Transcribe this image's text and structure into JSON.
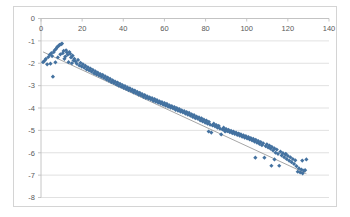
{
  "chart_data": {
    "type": "scatter",
    "title": "",
    "xlabel": "",
    "ylabel": "",
    "xlim": [
      0,
      140
    ],
    "ylim": [
      -8,
      0
    ],
    "grid": true,
    "legend": false,
    "x_ticks": [
      0,
      20,
      40,
      60,
      80,
      100,
      120,
      140
    ],
    "y_ticks": [
      0,
      -1,
      -2,
      -3,
      -4,
      -5,
      -6,
      -7,
      -8
    ],
    "marker_color": "#4472A0",
    "marker_shape": "diamond",
    "trendline": {
      "visible": true,
      "color": "#808080",
      "slope": -0.0425,
      "intercept": -1.45,
      "x_start": 1,
      "x_end": 129
    },
    "series": [
      {
        "name": "Series 1",
        "points": [
          [
            1.0,
            -1.95
          ],
          [
            1.8,
            -1.88
          ],
          [
            2.4,
            -1.8
          ],
          [
            3.0,
            -2.05
          ],
          [
            3.6,
            -1.72
          ],
          [
            4.2,
            -1.62
          ],
          [
            4.6,
            -2.02
          ],
          [
            5.0,
            -1.55
          ],
          [
            5.4,
            -1.68
          ],
          [
            5.8,
            -2.6
          ],
          [
            6.2,
            -1.5
          ],
          [
            6.6,
            -1.42
          ],
          [
            7.0,
            -1.96
          ],
          [
            7.4,
            -1.35
          ],
          [
            7.8,
            -1.28
          ],
          [
            8.2,
            -1.74
          ],
          [
            8.6,
            -1.22
          ],
          [
            9.0,
            -1.18
          ],
          [
            9.4,
            -1.6
          ],
          [
            9.8,
            -1.15
          ],
          [
            10.2,
            -1.12
          ],
          [
            10.6,
            -1.55
          ],
          [
            11.0,
            -1.45
          ],
          [
            11.4,
            -1.8
          ],
          [
            11.8,
            -1.7
          ],
          [
            12.2,
            -1.42
          ],
          [
            12.6,
            -1.52
          ],
          [
            13.0,
            -1.62
          ],
          [
            13.4,
            -1.95
          ],
          [
            13.8,
            -1.5
          ],
          [
            14.2,
            -1.58
          ],
          [
            14.6,
            -1.74
          ],
          [
            15.0,
            -2.0
          ],
          [
            15.4,
            -1.66
          ],
          [
            15.8,
            -1.88
          ],
          [
            16.2,
            -1.8
          ],
          [
            16.8,
            -1.92
          ],
          [
            17.4,
            -2.02
          ],
          [
            18.0,
            -1.85
          ],
          [
            18.6,
            -2.1
          ],
          [
            19.2,
            -1.98
          ],
          [
            19.8,
            -2.15
          ],
          [
            20.4,
            -2.05
          ],
          [
            21.0,
            -2.2
          ],
          [
            21.6,
            -2.12
          ],
          [
            22.2,
            -2.28
          ],
          [
            22.8,
            -2.18
          ],
          [
            23.4,
            -2.32
          ],
          [
            24.0,
            -2.24
          ],
          [
            24.6,
            -2.38
          ],
          [
            25.2,
            -2.3
          ],
          [
            25.8,
            -2.45
          ],
          [
            26.4,
            -2.36
          ],
          [
            27.0,
            -2.5
          ],
          [
            27.6,
            -2.42
          ],
          [
            28.2,
            -2.55
          ],
          [
            28.8,
            -2.48
          ],
          [
            29.4,
            -2.6
          ],
          [
            30.0,
            -2.52
          ],
          [
            30.6,
            -2.66
          ],
          [
            31.2,
            -2.58
          ],
          [
            31.8,
            -2.72
          ],
          [
            32.4,
            -2.64
          ],
          [
            33.0,
            -2.78
          ],
          [
            33.6,
            -2.7
          ],
          [
            34.2,
            -2.84
          ],
          [
            34.8,
            -2.76
          ],
          [
            35.4,
            -2.88
          ],
          [
            36.0,
            -2.82
          ],
          [
            36.6,
            -2.95
          ],
          [
            37.2,
            -2.86
          ],
          [
            37.8,
            -3.0
          ],
          [
            38.4,
            -2.92
          ],
          [
            39.0,
            -3.05
          ],
          [
            39.6,
            -2.98
          ],
          [
            40.2,
            -3.1
          ],
          [
            40.8,
            -3.02
          ],
          [
            41.4,
            -3.15
          ],
          [
            42.0,
            -3.08
          ],
          [
            42.6,
            -3.2
          ],
          [
            43.2,
            -3.12
          ],
          [
            43.8,
            -3.24
          ],
          [
            44.4,
            -3.18
          ],
          [
            45.0,
            -3.3
          ],
          [
            45.6,
            -3.22
          ],
          [
            46.2,
            -3.34
          ],
          [
            46.8,
            -3.28
          ],
          [
            47.4,
            -3.4
          ],
          [
            48.0,
            -3.32
          ],
          [
            48.6,
            -3.44
          ],
          [
            49.2,
            -3.38
          ],
          [
            49.8,
            -3.5
          ],
          [
            50.4,
            -3.42
          ],
          [
            51.0,
            -3.55
          ],
          [
            51.6,
            -3.48
          ],
          [
            52.2,
            -3.58
          ],
          [
            52.8,
            -3.52
          ],
          [
            53.4,
            -3.62
          ],
          [
            54.0,
            -3.56
          ],
          [
            54.6,
            -3.68
          ],
          [
            55.2,
            -3.6
          ],
          [
            55.8,
            -3.72
          ],
          [
            56.4,
            -3.65
          ],
          [
            57.0,
            -3.76
          ],
          [
            57.6,
            -3.7
          ],
          [
            58.2,
            -3.8
          ],
          [
            58.8,
            -3.74
          ],
          [
            59.4,
            -3.85
          ],
          [
            60.0,
            -3.78
          ],
          [
            60.6,
            -3.9
          ],
          [
            61.2,
            -3.82
          ],
          [
            61.8,
            -3.94
          ],
          [
            62.4,
            -3.88
          ],
          [
            63.0,
            -3.98
          ],
          [
            63.6,
            -3.92
          ],
          [
            64.2,
            -4.02
          ],
          [
            64.8,
            -3.96
          ],
          [
            65.4,
            -4.08
          ],
          [
            66.0,
            -4.0
          ],
          [
            66.6,
            -4.12
          ],
          [
            67.2,
            -4.05
          ],
          [
            67.8,
            -4.16
          ],
          [
            68.4,
            -4.1
          ],
          [
            69.0,
            -4.2
          ],
          [
            69.6,
            -4.14
          ],
          [
            70.2,
            -4.25
          ],
          [
            70.8,
            -4.18
          ],
          [
            71.4,
            -4.3
          ],
          [
            72.0,
            -4.22
          ],
          [
            72.6,
            -4.34
          ],
          [
            73.2,
            -4.28
          ],
          [
            73.8,
            -4.4
          ],
          [
            74.4,
            -4.32
          ],
          [
            75.0,
            -4.45
          ],
          [
            75.6,
            -4.38
          ],
          [
            76.2,
            -4.48
          ],
          [
            76.8,
            -4.42
          ],
          [
            77.4,
            -4.55
          ],
          [
            78.0,
            -4.46
          ],
          [
            78.6,
            -4.6
          ],
          [
            79.2,
            -4.52
          ],
          [
            79.8,
            -4.65
          ],
          [
            80.4,
            -4.56
          ],
          [
            81.0,
            -4.7
          ],
          [
            81.6,
            -4.62
          ],
          [
            82.2,
            -4.74
          ],
          [
            82.8,
            -5.1
          ],
          [
            83.4,
            -4.78
          ],
          [
            84.0,
            -4.7
          ],
          [
            84.6,
            -4.82
          ],
          [
            85.2,
            -4.76
          ],
          [
            85.8,
            -4.88
          ],
          [
            86.4,
            -4.8
          ],
          [
            87.0,
            -4.92
          ],
          [
            87.6,
            -5.18
          ],
          [
            88.2,
            -4.96
          ],
          [
            88.8,
            -4.88
          ],
          [
            89.4,
            -5.0
          ],
          [
            90.0,
            -4.94
          ],
          [
            90.6,
            -5.04
          ],
          [
            91.2,
            -4.98
          ],
          [
            91.8,
            -5.08
          ],
          [
            92.4,
            -5.02
          ],
          [
            93.0,
            -5.12
          ],
          [
            93.6,
            -5.06
          ],
          [
            94.2,
            -5.16
          ],
          [
            94.8,
            -5.1
          ],
          [
            95.4,
            -5.2
          ],
          [
            96.0,
            -5.14
          ],
          [
            96.6,
            -5.24
          ],
          [
            97.2,
            -5.18
          ],
          [
            97.8,
            -5.28
          ],
          [
            98.4,
            -5.22
          ],
          [
            99.0,
            -5.32
          ],
          [
            99.6,
            -5.26
          ],
          [
            100.2,
            -5.36
          ],
          [
            100.8,
            -5.3
          ],
          [
            101.4,
            -5.4
          ],
          [
            102.0,
            -5.34
          ],
          [
            102.6,
            -5.45
          ],
          [
            103.2,
            -5.38
          ],
          [
            103.8,
            -5.5
          ],
          [
            104.4,
            -5.42
          ],
          [
            105.0,
            -5.55
          ],
          [
            105.6,
            -5.48
          ],
          [
            106.2,
            -5.6
          ],
          [
            106.8,
            -5.52
          ],
          [
            107.4,
            -5.66
          ],
          [
            108.0,
            -5.58
          ],
          [
            108.6,
            -6.22
          ],
          [
            109.2,
            -5.7
          ],
          [
            109.8,
            -5.62
          ],
          [
            110.4,
            -5.76
          ],
          [
            111.0,
            -5.68
          ],
          [
            111.6,
            -5.82
          ],
          [
            112.2,
            -5.74
          ],
          [
            112.8,
            -5.9
          ],
          [
            113.4,
            -5.8
          ],
          [
            114.0,
            -6.0
          ],
          [
            114.6,
            -5.86
          ],
          [
            115.2,
            -6.05
          ],
          [
            115.8,
            -6.58
          ],
          [
            116.4,
            -5.95
          ],
          [
            117.0,
            -6.12
          ],
          [
            117.6,
            -6.02
          ],
          [
            118.2,
            -6.2
          ],
          [
            118.8,
            -6.08
          ],
          [
            119.4,
            -6.28
          ],
          [
            120.0,
            -6.14
          ],
          [
            120.6,
            -6.35
          ],
          [
            121.2,
            -6.2
          ],
          [
            121.8,
            -6.42
          ],
          [
            122.4,
            -6.28
          ],
          [
            123.0,
            -6.5
          ],
          [
            123.6,
            -6.34
          ],
          [
            124.2,
            -6.6
          ],
          [
            124.8,
            -6.85
          ],
          [
            125.4,
            -6.7
          ],
          [
            126.0,
            -6.88
          ],
          [
            126.6,
            -6.75
          ],
          [
            127.2,
            -6.92
          ],
          [
            127.8,
            -6.8
          ],
          [
            128.4,
            -6.78
          ],
          [
            129.0,
            -6.3
          ],
          [
            104.2,
            -6.22
          ],
          [
            112.0,
            -6.58
          ],
          [
            113.5,
            -6.3
          ],
          [
            119.0,
            -6.05
          ],
          [
            127.0,
            -6.35
          ],
          [
            89.5,
            -5.05
          ],
          [
            96.5,
            -5.18
          ],
          [
            81.5,
            -5.05
          ]
        ]
      }
    ]
  }
}
